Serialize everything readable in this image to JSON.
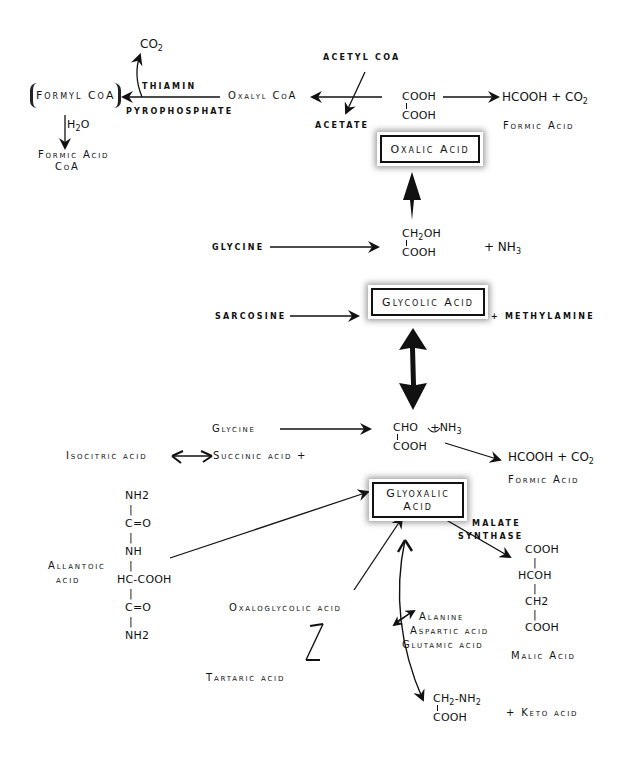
{
  "diagram": {
    "title": "",
    "nodes": {
      "co2_top": {
        "base": "CO",
        "sub": "2"
      },
      "formyl_coa": "Formyl CoA",
      "thiamin": "THIAMIN",
      "pyrophosphate": "PYROPHOSPHATE",
      "oxalyl_coa": "Oxalyl CoA",
      "acetyl_coa": "ACETYL CoA",
      "acetate": "ACETATE",
      "h2o": {
        "base": "H",
        "sub": "2",
        "tail": "O"
      },
      "formic_acid_coa": {
        "line1": "Formic Acid",
        "line2": "CoA"
      },
      "oxalic_formula": {
        "line1": "COOH",
        "line2": "COOH"
      },
      "products_top": {
        "text": "HCOOH + CO",
        "sub": "2"
      },
      "formic_acid_top": "Formic Acid",
      "oxalic_acid": "Oxalic Acid",
      "glycine_top": "GLYCINE",
      "glycolic_formula": {
        "line1_base": "CH",
        "line1_sub": "2",
        "line1_tail": "OH",
        "line2": "COOH"
      },
      "nh3_top": {
        "text": "+ NH",
        "sub": "3"
      },
      "sarcosine": "SARCOSINE",
      "glycolic_acid": "Glycolic Acid",
      "methylamine": "+ METHYLAMINE",
      "glycine_mid": "Glycine",
      "glyoxalic_formula": {
        "line1": "CHO",
        "nh3": "+NH",
        "nh3_sub": "3",
        "line2": "COOH"
      },
      "isocitric_acid": "Isocitric acid",
      "succinic_acid": "Succinic acid +",
      "products_mid": {
        "text": "HCOOH + CO",
        "sub": "2"
      },
      "formic_acid_mid": "Formic Acid",
      "glyoxalic_acid": {
        "line1": "Glyoxalic",
        "line2": "Acid"
      },
      "malate_synthase": {
        "line1": "MALATE",
        "line2": "SYNTHASE"
      },
      "allantoic_acid": {
        "line1": "Allantoic",
        "line2": "acid"
      },
      "allantoic_formula": [
        "NH2",
        "C=O",
        "NH",
        "HC-COOH",
        "C=O",
        "NH2"
      ],
      "malic_formula": [
        "COOH",
        "HCOH",
        "CH2",
        "COOH"
      ],
      "malic_acid": "Malic Acid",
      "oxaloglycolic_acid": "Oxaloglycolic acid",
      "tartaric_acid": "Tartaric acid",
      "amino_acids": [
        "Alanine",
        "Aspartic acid",
        "Glutamic acid"
      ],
      "glycine_formula": {
        "line1_base": "CH",
        "line1_sub": "2",
        "line1_tail": "-NH",
        "line1_sub2": "2",
        "line2": "COOH"
      },
      "keto_acid": "+ Keto acid"
    },
    "edges": [
      {
        "from": "oxalic_formula",
        "to": "oxalyl_coa",
        "label": "acetyl_coa -> acetate"
      },
      {
        "from": "oxalyl_coa",
        "to": "formyl_coa",
        "label": "thiamin pyrophosphate",
        "side_product": "CO2"
      },
      {
        "from": "formyl_coa",
        "to": "formic_acid_coa",
        "label": "H2O"
      },
      {
        "from": "oxalic_formula",
        "to": "products_top"
      },
      {
        "from": "glycolic_formula",
        "to": "oxalic_acid"
      },
      {
        "from": "glycine_top",
        "to": "glycolic_formula"
      },
      {
        "from": "sarcosine",
        "to": "glycolic_acid"
      },
      {
        "from": "glycolic_acid",
        "to": "glyoxalic_formula",
        "bidirectional": true
      },
      {
        "from": "glycine_mid",
        "to": "glyoxalic_formula"
      },
      {
        "from": "glyoxalic_formula",
        "to": "products_mid"
      },
      {
        "from": "succinic_acid",
        "to": "isocitric_acid",
        "reversible": true
      },
      {
        "from": "allantoic_acid",
        "to": "glyoxalic_acid"
      },
      {
        "from": "oxaloglycolic_acid",
        "to": "glyoxalic_acid"
      },
      {
        "from": "tartaric_acid",
        "to": "oxaloglycolic_acid",
        "reversible": true
      },
      {
        "from": "glyoxalic_acid",
        "to": "malic_formula",
        "label": "malate synthase"
      },
      {
        "from": "glyoxalic_acid",
        "to": "glycine_formula",
        "bidirectional": true,
        "cofactor": "amino_acids"
      }
    ]
  }
}
